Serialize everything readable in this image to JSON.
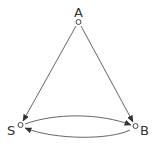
{
  "diagram": {
    "type": "directed-graph",
    "colors": {
      "line": "#555555",
      "node_stroke": "#444444",
      "label": "#333333",
      "background": "#ffffff"
    },
    "nodes": [
      {
        "id": "A",
        "label": "A"
      },
      {
        "id": "S",
        "label": "S"
      },
      {
        "id": "B",
        "label": "B"
      }
    ],
    "edges": [
      {
        "from": "A",
        "to": "S"
      },
      {
        "from": "A",
        "to": "B"
      },
      {
        "from": "S",
        "to": "B"
      },
      {
        "from": "B",
        "to": "S"
      }
    ]
  }
}
